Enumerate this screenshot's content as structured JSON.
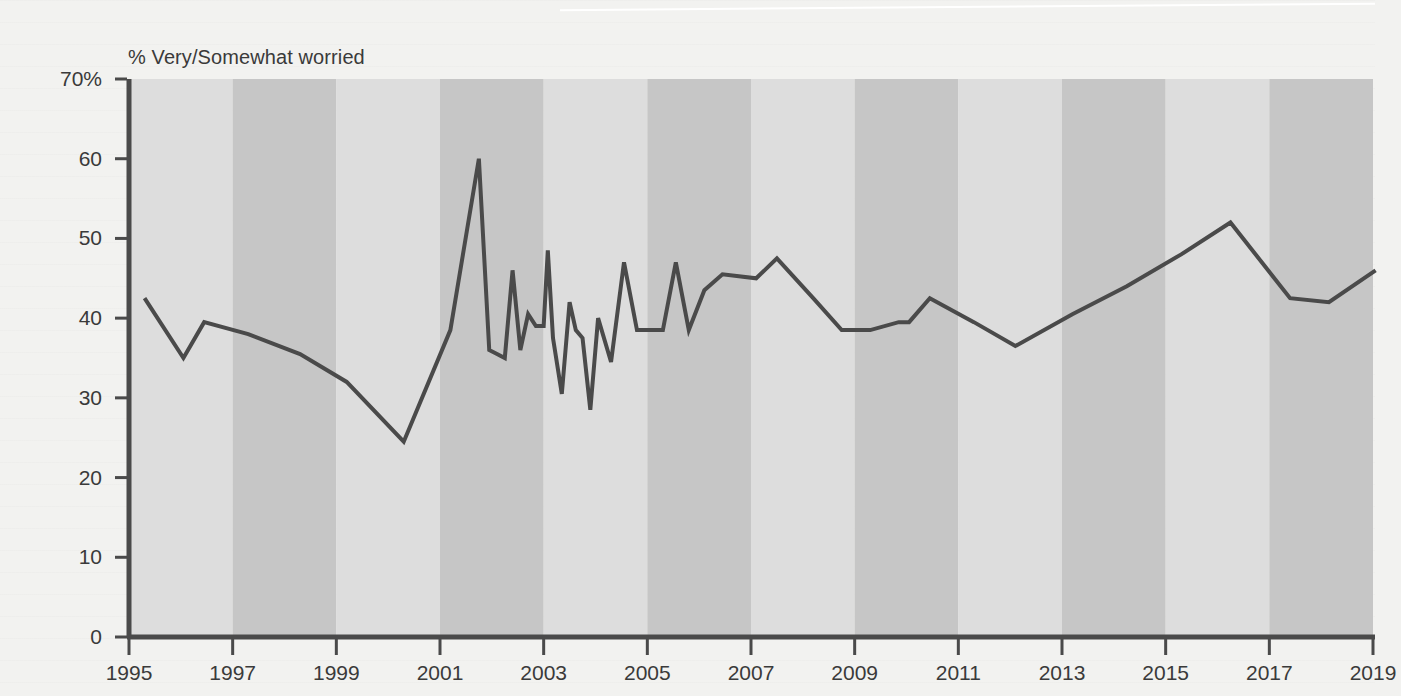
{
  "chart_data": {
    "type": "line",
    "title": "",
    "subtitle": "",
    "ylabel": "% Very/Somewhat worried",
    "xlabel": "",
    "ylim": [
      0,
      70
    ],
    "xlim": [
      1995,
      2019
    ],
    "grid": false,
    "legend_position": "none",
    "y_ticks": [
      0,
      10,
      20,
      30,
      40,
      50,
      60,
      70
    ],
    "y_tick_labels": [
      "0",
      "10",
      "20",
      "30",
      "40",
      "50",
      "60",
      "70%"
    ],
    "x_ticks": [
      1995,
      1997,
      1999,
      2001,
      2003,
      2005,
      2007,
      2009,
      2011,
      2013,
      2015,
      2017,
      2019
    ],
    "x_tick_labels": [
      "1995",
      "1997",
      "1999",
      "2001",
      "2003",
      "2005",
      "2007",
      "2009",
      "2011",
      "2013",
      "2015",
      "2017",
      "2019"
    ],
    "background_bands": {
      "description": "alternating vertical shaded bands, each two years wide, starting at 1995",
      "light_color": "#dddddd",
      "dark_color": "#c6c6c6",
      "band_width_years": 2
    },
    "line_color": "#4a4a4a",
    "line_width": 4,
    "series": [
      {
        "name": "Very/Somewhat worried",
        "x": [
          1995.3,
          1996.05,
          1996.45,
          1997.3,
          1998.3,
          1999.2,
          2000.3,
          2001.2,
          2001.75,
          2001.95,
          2002.1,
          2002.25,
          2002.4,
          2002.55,
          2002.7,
          2002.85,
          2003.0,
          2003.08,
          2003.18,
          2003.35,
          2003.5,
          2003.62,
          2003.75,
          2003.9,
          2004.05,
          2004.3,
          2004.55,
          2004.8,
          2005.05,
          2005.3,
          2005.55,
          2005.8,
          2006.1,
          2006.45,
          2007.1,
          2007.5,
          2008.2,
          2008.75,
          2009.3,
          2009.85,
          2010.05,
          2010.45,
          2011.3,
          2012.1,
          2013.2,
          2014.25,
          2015.3,
          2016.25,
          2017.4,
          2018.15,
          2019.05
        ],
        "values": [
          42.5,
          35.0,
          39.5,
          38.0,
          35.5,
          32.0,
          24.5,
          38.5,
          60.0,
          36.0,
          35.5,
          35.0,
          46.0,
          36.0,
          40.5,
          39.0,
          39.0,
          48.5,
          37.5,
          30.5,
          42.0,
          38.5,
          37.5,
          28.5,
          40.0,
          34.5,
          47.0,
          38.5,
          38.5,
          38.5,
          47.0,
          38.5,
          43.5,
          45.5,
          45.0,
          47.5,
          42.5,
          38.5,
          38.5,
          39.5,
          39.5,
          42.5,
          39.5,
          36.5,
          40.5,
          44.0,
          48.0,
          52.0,
          42.5,
          42.0,
          46.0
        ]
      }
    ]
  },
  "plot_geometry": {
    "left_px": 89,
    "right_px": 1333,
    "top_px": 63,
    "bottom_px": 621
  }
}
